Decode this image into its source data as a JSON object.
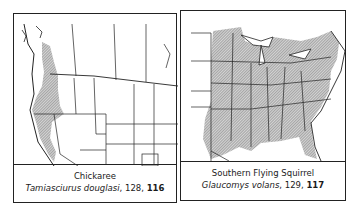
{
  "maps": [
    {
      "common_name": "Chickaree",
      "scientific_name": "Tamiasciurus douglasi",
      "text_page": "128",
      "plate": "116",
      "sep": ", ",
      "range_region": "Pacific Northwest"
    },
    {
      "common_name": "Southern Flying Squirrel",
      "scientific_name": "Glaucomys volans",
      "text_page": "129",
      "plate": "117",
      "sep": ", ",
      "range_region": "Eastern United States"
    }
  ],
  "colors": {
    "range_fill": "#9a9a9a",
    "line": "#222222",
    "background": "#ffffff"
  }
}
